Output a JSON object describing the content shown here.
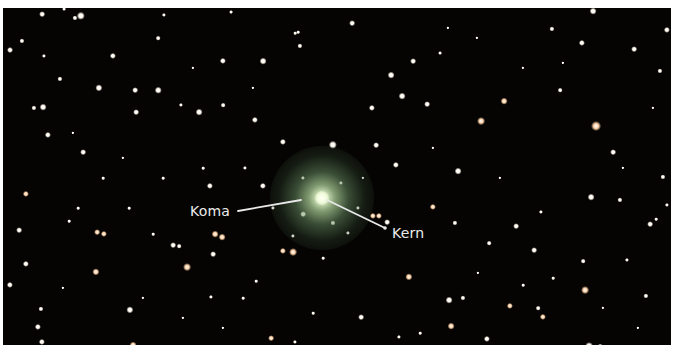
{
  "image": {
    "subject": "comet photograph against starfield",
    "background_color": "#060403",
    "border_color": "#ffffff"
  },
  "comet": {
    "center": [
      319,
      190
    ],
    "coma_radius": 52,
    "nucleus_radius": 7
  },
  "labels": [
    {
      "id": "koma",
      "text": "Koma",
      "x": 187,
      "y": 195,
      "line": [
        235,
        203,
        298,
        192
      ]
    },
    {
      "id": "kern",
      "text": "Kern",
      "x": 389,
      "y": 217,
      "line": [
        324,
        192,
        382,
        220
      ]
    }
  ],
  "colors": {
    "label_text": "#ececec",
    "leader_line": "#e8e8e8",
    "star_white": "#fff8ee",
    "star_warm": "#ffd2a8"
  },
  "stars": [
    [
      39,
      6,
      2.2,
      "w"
    ],
    [
      19,
      33,
      2,
      "w"
    ],
    [
      78,
      8,
      3.2,
      "w"
    ],
    [
      72,
      10,
      2,
      "w"
    ],
    [
      41,
      48,
      1.6,
      "w"
    ],
    [
      110,
      48,
      2.4,
      "w"
    ],
    [
      7,
      42,
      2.3,
      "w"
    ],
    [
      57,
      71,
      2,
      "w"
    ],
    [
      96,
      80,
      2.8,
      "w"
    ],
    [
      132,
      82,
      2.2,
      "w"
    ],
    [
      155,
      82,
      2.5,
      "w"
    ],
    [
      155,
      30,
      1.8,
      "w"
    ],
    [
      220,
      53,
      2.4,
      "w"
    ],
    [
      260,
      53,
      2.6,
      "w"
    ],
    [
      297,
      38,
      2,
      "w"
    ],
    [
      31,
      100,
      2,
      "w"
    ],
    [
      40,
      99,
      2.6,
      "w"
    ],
    [
      45,
      127,
      2.4,
      "w"
    ],
    [
      80,
      144,
      2.2,
      "w"
    ],
    [
      133,
      104,
      2.2,
      "w"
    ],
    [
      178,
      97,
      1.6,
      "w"
    ],
    [
      196,
      104,
      2.6,
      "w"
    ],
    [
      220,
      97,
      1.8,
      "w"
    ],
    [
      252,
      112,
      2.4,
      "w"
    ],
    [
      280,
      134,
      2.4,
      "w"
    ],
    [
      330,
      137,
      3.2,
      "w"
    ],
    [
      61,
      1,
      1.5,
      "w"
    ],
    [
      161,
      7,
      1.6,
      "w"
    ],
    [
      228,
      4,
      1.5,
      "w"
    ],
    [
      292,
      25,
      1.4,
      "w"
    ],
    [
      295,
      24,
      1.4,
      "w"
    ],
    [
      349,
      15,
      2.2,
      "w"
    ],
    [
      410,
      53,
      2.2,
      "w"
    ],
    [
      388,
      67,
      2.6,
      "w"
    ],
    [
      437,
      45,
      1.5,
      "w"
    ],
    [
      399,
      88,
      2.6,
      "w"
    ],
    [
      424,
      96,
      2.2,
      "w"
    ],
    [
      369,
      100,
      2.4,
      "w"
    ],
    [
      478,
      113,
      3,
      "o"
    ],
    [
      373,
      137,
      2.2,
      "w"
    ],
    [
      393,
      157,
      2.4,
      "w"
    ],
    [
      455,
      163,
      2.6,
      "w"
    ],
    [
      501,
      93,
      2.6,
      "o"
    ],
    [
      593,
      118,
      3.8,
      "o"
    ],
    [
      579,
      35,
      2.4,
      "w"
    ],
    [
      549,
      21,
      2,
      "w"
    ],
    [
      631,
      41,
      2.2,
      "w"
    ],
    [
      657,
      63,
      2,
      "w"
    ],
    [
      557,
      82,
      1.8,
      "w"
    ],
    [
      610,
      144,
      2.2,
      "w"
    ],
    [
      660,
      169,
      2,
      "w"
    ],
    [
      664,
      22,
      2.4,
      "w"
    ],
    [
      590,
      3,
      2.6,
      "w"
    ],
    [
      23,
      186,
      2.4,
      "o"
    ],
    [
      16,
      222,
      2.2,
      "w"
    ],
    [
      23,
      256,
      2.4,
      "w"
    ],
    [
      7,
      277,
      2.4,
      "w"
    ],
    [
      38,
      301,
      2,
      "w"
    ],
    [
      35,
      319,
      2.4,
      "w"
    ],
    [
      39,
      334,
      2.4,
      "w"
    ],
    [
      94,
      224,
      2.2,
      "o"
    ],
    [
      101,
      226,
      2.4,
      "o"
    ],
    [
      170,
      237,
      2.2,
      "w"
    ],
    [
      176,
      238,
      1.8,
      "w"
    ],
    [
      93,
      264,
      2.8,
      "o"
    ],
    [
      184,
      259,
      3,
      "o"
    ],
    [
      127,
      302,
      2.8,
      "w"
    ],
    [
      130,
      337,
      2.6,
      "o"
    ],
    [
      207,
      178,
      2.4,
      "w"
    ],
    [
      260,
      178,
      2.4,
      "w"
    ],
    [
      212,
      226,
      2.6,
      "o"
    ],
    [
      219,
      229,
      2.6,
      "o"
    ],
    [
      210,
      246,
      2.2,
      "w"
    ],
    [
      280,
      243,
      2.4,
      "o"
    ],
    [
      290,
      244,
      3,
      "o"
    ],
    [
      208,
      289,
      1.6,
      "w"
    ],
    [
      268,
      330,
      2.2,
      "o"
    ],
    [
      292,
      334,
      1.6,
      "w"
    ],
    [
      370,
      208,
      2.4,
      "o"
    ],
    [
      376,
      208,
      2.4,
      "o"
    ],
    [
      384,
      214,
      2.2,
      "w"
    ],
    [
      430,
      199,
      2.4,
      "o"
    ],
    [
      406,
      269,
      2.8,
      "o"
    ],
    [
      358,
      309,
      2.2,
      "w"
    ],
    [
      446,
      292,
      2.6,
      "w"
    ],
    [
      460,
      290,
      2,
      "w"
    ],
    [
      507,
      298,
      2.4,
      "o"
    ],
    [
      540,
      309,
      2.4,
      "o"
    ],
    [
      582,
      282,
      3,
      "o"
    ],
    [
      535,
      300,
      1.8,
      "w"
    ],
    [
      448,
      318,
      2.6,
      "o"
    ],
    [
      484,
      331,
      2.4,
      "w"
    ],
    [
      452,
      215,
      2,
      "w"
    ],
    [
      486,
      235,
      1.8,
      "w"
    ],
    [
      513,
      218,
      2.2,
      "w"
    ],
    [
      531,
      242,
      2.2,
      "w"
    ],
    [
      588,
      189,
      2.6,
      "w"
    ],
    [
      617,
      192,
      2,
      "w"
    ],
    [
      647,
      216,
      2.2,
      "w"
    ],
    [
      643,
      288,
      2,
      "w"
    ],
    [
      586,
      338,
      3,
      "w"
    ],
    [
      597,
      338,
      1.8,
      "w"
    ],
    [
      653,
      211,
      1.4,
      "w"
    ],
    [
      538,
      204,
      1.6,
      "w"
    ],
    [
      580,
      253,
      1.8,
      "w"
    ],
    [
      624,
      252,
      1.6,
      "w"
    ],
    [
      664,
      197,
      1.6,
      "w"
    ],
    [
      520,
      277,
      1.4,
      "w"
    ],
    [
      550,
      270,
      1.4,
      "w"
    ],
    [
      396,
      329,
      1.6,
      "w"
    ],
    [
      417,
      325,
      1.4,
      "w"
    ],
    [
      126,
      200,
      1.4,
      "w"
    ],
    [
      150,
      226,
      1.4,
      "w"
    ],
    [
      66,
      213,
      1.4,
      "w"
    ],
    [
      75,
      200,
      1.4,
      "w"
    ],
    [
      242,
      160,
      1.6,
      "w"
    ],
    [
      200,
      160,
      1.4,
      "w"
    ],
    [
      160,
      170,
      1.4,
      "w"
    ],
    [
      100,
      170,
      1.4,
      "w"
    ],
    [
      253,
      273,
      1.4,
      "w"
    ],
    [
      240,
      290,
      1.4,
      "w"
    ],
    [
      310,
      305,
      1.4,
      "w"
    ],
    [
      320,
      250,
      1.4,
      "w"
    ],
    [
      445,
      20,
      1.3,
      "w"
    ],
    [
      474,
      30,
      1.3,
      "w"
    ],
    [
      520,
      60,
      1.3,
      "w"
    ],
    [
      560,
      55,
      1.3,
      "w"
    ],
    [
      650,
      100,
      1.3,
      "w"
    ],
    [
      620,
      160,
      1.3,
      "w"
    ],
    [
      430,
      140,
      1.3,
      "w"
    ],
    [
      360,
      170,
      1.3,
      "w"
    ],
    [
      497,
      170,
      1.3,
      "w"
    ],
    [
      475,
      265,
      1.3,
      "w"
    ],
    [
      635,
      320,
      1.3,
      "w"
    ],
    [
      600,
      300,
      1.3,
      "w"
    ],
    [
      70,
      125,
      1.3,
      "w"
    ],
    [
      190,
      60,
      1.3,
      "w"
    ],
    [
      250,
      80,
      1.3,
      "w"
    ],
    [
      120,
      150,
      1.3,
      "w"
    ],
    [
      140,
      290,
      1.3,
      "w"
    ],
    [
      60,
      280,
      1.3,
      "w"
    ],
    [
      180,
      310,
      1.3,
      "w"
    ],
    [
      220,
      320,
      1.3,
      "w"
    ],
    [
      330,
      215,
      2,
      "w"
    ],
    [
      300,
      206,
      2.2,
      "w"
    ],
    [
      338,
      175,
      1.6,
      "w"
    ],
    [
      300,
      170,
      1.6,
      "w"
    ],
    [
      290,
      228,
      1.6,
      "w"
    ],
    [
      345,
      225,
      1.6,
      "w"
    ],
    [
      270,
      200,
      1.6,
      "w"
    ],
    [
      355,
      200,
      1.6,
      "w"
    ]
  ]
}
